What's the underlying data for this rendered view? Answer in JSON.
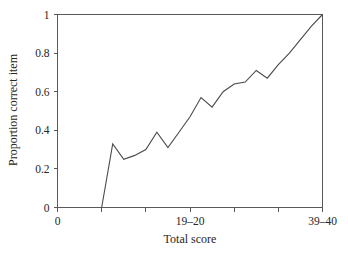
{
  "chart_data": {
    "type": "line",
    "title": "",
    "xlabel": "Total score",
    "ylabel": "Proportion correct item",
    "xlim": [
      0,
      24
    ],
    "ylim": [
      0,
      1
    ],
    "grid": false,
    "legend": null,
    "x_tick_positions": [
      0,
      4,
      8,
      12,
      16,
      20,
      24
    ],
    "x_tick_labels": [
      "0",
      "",
      "",
      "19–20",
      "",
      "",
      "39–40"
    ],
    "y_tick_positions": [
      0,
      0.2,
      0.4,
      0.6,
      0.8,
      1
    ],
    "y_tick_labels": [
      "0",
      "0.2",
      "0.4",
      "0.6",
      "0.8",
      "1"
    ],
    "x": [
      4.0,
      5.0,
      6.0,
      7.0,
      8.0,
      9.0,
      10.0,
      11.0,
      12.0,
      13.0,
      14.0,
      15.0,
      16.0,
      17.0,
      18.0,
      19.0,
      20.0,
      21.0,
      22.0,
      23.0,
      24.0
    ],
    "values": [
      0.0,
      0.33,
      0.25,
      0.27,
      0.3,
      0.39,
      0.31,
      0.39,
      0.47,
      0.57,
      0.52,
      0.6,
      0.64,
      0.65,
      0.71,
      0.67,
      0.74,
      0.8,
      0.87,
      0.94,
      1.0
    ],
    "series": [
      {
        "name": "Proportion correct item",
        "values": [
          0.0,
          0.33,
          0.25,
          0.27,
          0.3,
          0.39,
          0.31,
          0.39,
          0.47,
          0.57,
          0.52,
          0.6,
          0.64,
          0.65,
          0.71,
          0.67,
          0.74,
          0.8,
          0.87,
          0.94,
          1.0
        ]
      }
    ]
  },
  "axes": {
    "y_label": "Proportion correct item",
    "x_label": "Total score",
    "y_ticks": [
      {
        "label": "1",
        "value": 1
      },
      {
        "label": "0.8",
        "value": 0.8
      },
      {
        "label": "0.6",
        "value": 0.6
      },
      {
        "label": "0.4",
        "value": 0.4
      },
      {
        "label": "0.2",
        "value": 0.2
      },
      {
        "label": "0",
        "value": 0
      }
    ],
    "x_ticks": [
      {
        "label": "0",
        "value": 0
      },
      {
        "label": "",
        "value": 4
      },
      {
        "label": "",
        "value": 8
      },
      {
        "label": "19–20",
        "value": 12
      },
      {
        "label": "",
        "value": 16
      },
      {
        "label": "",
        "value": 20
      },
      {
        "label": "39–40",
        "value": 24
      }
    ]
  },
  "style": {
    "line_color": "#4a4a4c",
    "axis_color": "#59595b",
    "text_color": "#262626",
    "background": "#ffffff"
  }
}
